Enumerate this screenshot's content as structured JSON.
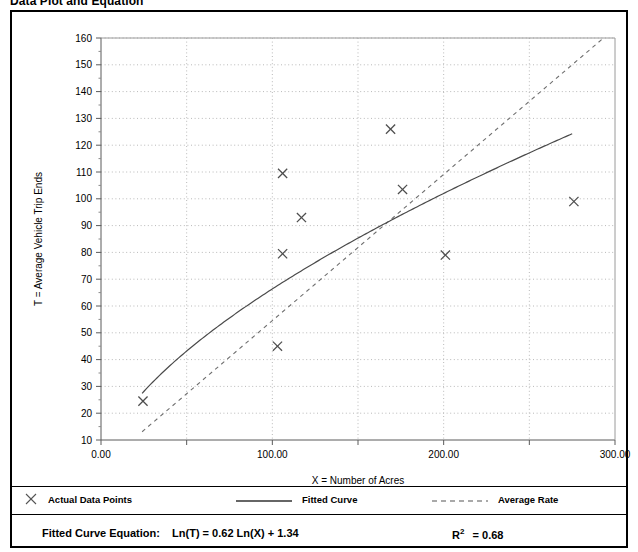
{
  "title": "Data Plot and Equation",
  "chart_data": {
    "type": "scatter",
    "title": "Data Plot and Equation",
    "xlabel": "X = Number of Acres",
    "ylabel": "T = Average Vehicle Trip Ends",
    "xlim": [
      0,
      300
    ],
    "ylim": [
      10,
      160
    ],
    "xticks": [
      0,
      50,
      100,
      150,
      200,
      250,
      300
    ],
    "xticklabels": [
      "0.00",
      "",
      "100.00",
      "",
      "200.00",
      "",
      "300.00"
    ],
    "yticks": [
      10,
      20,
      30,
      40,
      50,
      60,
      70,
      80,
      90,
      100,
      110,
      120,
      130,
      140,
      150,
      160
    ],
    "yticklabels": [
      "10",
      "20",
      "30",
      "40",
      "50",
      "60",
      "70",
      "80",
      "90",
      "100",
      "110",
      "120",
      "130",
      "140",
      "150",
      "160"
    ],
    "grid": true,
    "legend_position": "below-axes",
    "series": [
      {
        "name": "Actual Data Points",
        "type": "scatter",
        "marker": "x",
        "color": "#555555",
        "points": [
          {
            "x": 24.5,
            "y": 24.5
          },
          {
            "x": 103.0,
            "y": 45.0
          },
          {
            "x": 106.0,
            "y": 79.5
          },
          {
            "x": 106.0,
            "y": 109.5
          },
          {
            "x": 117.0,
            "y": 93.0
          },
          {
            "x": 169.0,
            "y": 126.0
          },
          {
            "x": 176.0,
            "y": 103.5
          },
          {
            "x": 201.0,
            "y": 79.0
          },
          {
            "x": 276.0,
            "y": 99.0
          }
        ]
      },
      {
        "name": "Fitted Curve",
        "type": "line",
        "style": "solid",
        "color": "#444444",
        "equation": "Ln(T) = 0.62 Ln(X) + 1.34",
        "a": 1.34,
        "b": 0.62,
        "x_range": [
          24,
          275
        ]
      },
      {
        "name": "Average Rate",
        "type": "line",
        "style": "dashed",
        "color": "#777777",
        "slope": 0.5455,
        "x_range": [
          24,
          300
        ]
      }
    ]
  },
  "legend": {
    "items": [
      {
        "marker": "x",
        "label": "Actual Data Points"
      },
      {
        "marker": "solid-line",
        "label": "Fitted Curve"
      },
      {
        "marker": "dashed-line",
        "label": "Average Rate"
      }
    ]
  },
  "footer": {
    "equation_label": "Fitted Curve Equation:",
    "equation": "Ln(T) = 0.62 Ln(X) + 1.34",
    "r2_label": "R",
    "r2_exp": "2",
    "r2_value": "= 0.68"
  }
}
